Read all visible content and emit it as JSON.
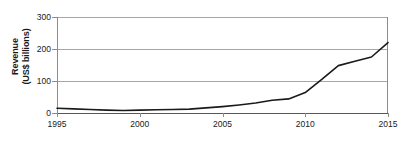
{
  "chart_data": {
    "type": "line",
    "title": "",
    "xlabel": "",
    "ylabel": "Revenue (US$ billions)",
    "ylabel_line1": "Revenue",
    "ylabel_line2": "(US$ billions)",
    "xlim": [
      1995,
      2015
    ],
    "ylim": [
      0,
      300
    ],
    "grid": true,
    "legend": "none",
    "y_ticks": [
      0,
      100,
      200,
      300
    ],
    "y_tick_labels": [
      "0",
      "100",
      "200",
      "300"
    ],
    "x_ticks": [
      1995,
      2000,
      2005,
      2010,
      2015
    ],
    "x_tick_labels": [
      "1995",
      "2000",
      "2005",
      "2010",
      "2015"
    ],
    "x": [
      1995,
      1996,
      1997,
      1998,
      1999,
      2000,
      2001,
      2002,
      2003,
      2004,
      2005,
      2006,
      2007,
      2008,
      2009,
      2010,
      2011,
      2012,
      2013,
      2014,
      2015
    ],
    "values": [
      15,
      13,
      11,
      9,
      8,
      9,
      10,
      11,
      12,
      16,
      20,
      25,
      31,
      40,
      44,
      64,
      105,
      148,
      162,
      175,
      220
    ],
    "series": [
      {
        "name": "Revenue",
        "values": [
          15,
          13,
          11,
          9,
          8,
          9,
          10,
          11,
          12,
          16,
          20,
          25,
          31,
          40,
          44,
          64,
          105,
          148,
          162,
          175,
          220
        ]
      }
    ],
    "colors": {
      "line": "#1a1a1a",
      "grid": "#a6a6a6",
      "axis": "#8c8c8c",
      "text": "#1a1a1a",
      "background": "#ffffff"
    }
  }
}
